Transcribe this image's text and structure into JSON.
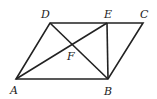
{
  "diagram": {
    "type": "geometry",
    "shape": "parallelogram ABCD",
    "points": {
      "A": {
        "label": "A",
        "x": 16,
        "y": 79
      },
      "B": {
        "label": "B",
        "x": 108,
        "y": 79
      },
      "C": {
        "label": "C",
        "x": 143,
        "y": 23
      },
      "D": {
        "label": "D",
        "x": 50,
        "y": 23
      },
      "E": {
        "label": "E",
        "x": 107,
        "y": 23
      },
      "F": {
        "label": "F",
        "x": 74,
        "y": 45
      }
    },
    "segments": [
      "AB",
      "BC",
      "CD",
      "DA",
      "AE",
      "DB",
      "EB"
    ],
    "line_color": "#222222"
  }
}
